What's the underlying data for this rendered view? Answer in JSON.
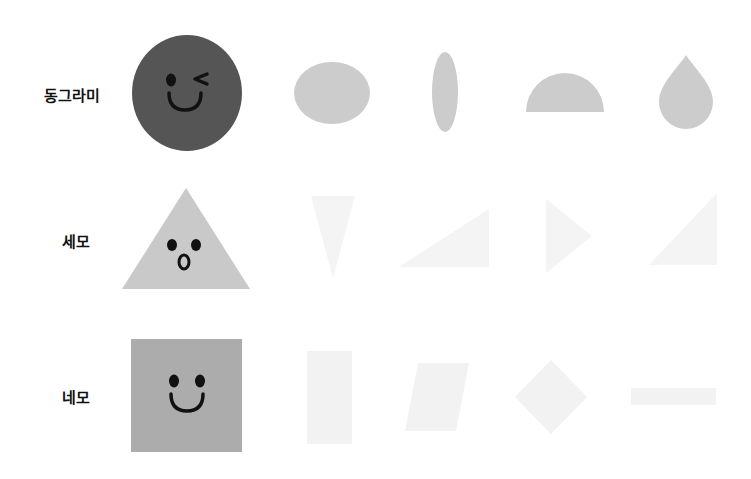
{
  "header": {
    "cut_off_text": "· · · · · · · · · · · · · · ·"
  },
  "colors": {
    "circle_main": "#555555",
    "circle_variants": "#cccccc",
    "triangle_main": "#c9c9c9",
    "triangle_variants": "#f4f4f4",
    "square_main": "#acacac",
    "square_variants": "#f2f2f2",
    "face": "#111111"
  },
  "rows": [
    {
      "label": "동그라미",
      "main_shape": "circle-wink-face",
      "variants": [
        "oval",
        "thin-vertical-ellipse",
        "semicircle",
        "teardrop"
      ]
    },
    {
      "label": "세모",
      "main_shape": "triangle-surprised-face",
      "variants": [
        "inverted-triangle",
        "right-triangle-wide",
        "right-pointing-triangle",
        "right-triangle-tall"
      ]
    },
    {
      "label": "네모",
      "main_shape": "square-smile-face",
      "variants": [
        "tall-rectangle",
        "parallelogram",
        "diamond",
        "thin-horizontal-bar"
      ]
    }
  ]
}
